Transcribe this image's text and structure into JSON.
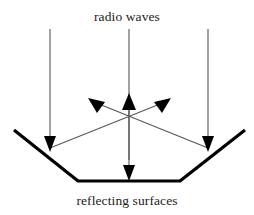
{
  "figure": {
    "title": "radio waves",
    "caption": "reflecting surfaces",
    "width": 254,
    "height": 215,
    "background_color": "#ffffff"
  },
  "labels": {
    "top": "radio waves",
    "bottom": "reflecting surfaces"
  },
  "colors": {
    "ray": "#555555",
    "surface": "#000000",
    "arrowhead": "#000000",
    "text": "#1a1a1a"
  },
  "diagram_data": {
    "type": "ray-diagram",
    "description": "Three vertical radio wave rays travel downward onto a trough of reflecting surfaces; two outer rays strike the slanted side surfaces and reflect diagonally upward and outward, while the centre ray strikes the flat bottom surface and reflects straight up.",
    "surfaces": [
      {
        "name": "left-slanted-surface",
        "x1": 14,
        "y1": 130,
        "x2": 78,
        "y2": 181,
        "stroke_width": 3
      },
      {
        "name": "bottom-flat-surface",
        "x1": 78,
        "y1": 181,
        "x2": 180,
        "y2": 181,
        "stroke_width": 3
      },
      {
        "name": "right-slanted-surface",
        "x1": 180,
        "y1": 181,
        "x2": 245,
        "y2": 130,
        "stroke_width": 3
      }
    ],
    "incoming_rays": [
      {
        "name": "incoming-ray-left",
        "x1": 50,
        "y1": 29,
        "x2": 50,
        "y2": 151,
        "arrow": "down"
      },
      {
        "name": "incoming-ray-center",
        "x1": 129,
        "y1": 29,
        "x2": 129,
        "y2": 180,
        "arrow": "down"
      },
      {
        "name": "incoming-ray-right",
        "x1": 208,
        "y1": 29,
        "x2": 208,
        "y2": 151,
        "arrow": "down"
      }
    ],
    "reflected_rays": [
      {
        "name": "reflected-ray-left-to-upper-right",
        "x1": 50,
        "y1": 148,
        "x2": 170,
        "y2": 100,
        "arrow": "up-right"
      },
      {
        "name": "reflected-ray-right-to-upper-left",
        "x1": 208,
        "y1": 148,
        "x2": 89,
        "y2": 100,
        "arrow": "up-left"
      },
      {
        "name": "reflected-ray-center-up",
        "x1": 129,
        "y1": 160,
        "x2": 129,
        "y2": 94,
        "arrow": "up"
      }
    ],
    "crossing_point": {
      "x": 129,
      "y": 122
    }
  }
}
